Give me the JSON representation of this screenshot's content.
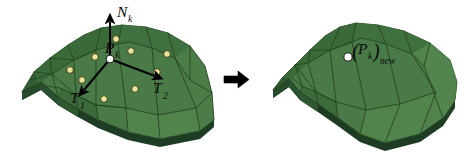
{
  "figure": {
    "background_color": "#ffffff",
    "width": 476,
    "height": 159
  },
  "colors": {
    "surface_light": "#5c8a55",
    "surface_mid": "#4a7a47",
    "surface_dark": "#3d6b3b",
    "surface_darker": "#2f5730",
    "surface_shadow": "#27492a",
    "side_face": "#2b5230",
    "side_face_dark": "#1e3c23",
    "mesh_line": "#24431f",
    "control_point_fill": "#e8e4a0",
    "control_point_stroke": "#3a3a12",
    "vertex_point_fill": "#ffffff",
    "vertex_point_stroke": "#1a1a1a",
    "arrow_black": "#000000",
    "label_text": "#0a0a0a"
  },
  "left_panel": {
    "name": "original-surface-patch",
    "labels": {
      "normal": {
        "base": "N",
        "subscript": "k"
      },
      "point": {
        "base": "P",
        "subscript": "k"
      },
      "tangent1": {
        "base": "T",
        "subscript": "1"
      },
      "tangent2": {
        "base": "T",
        "subscript": "2"
      }
    },
    "vectors": [
      {
        "name": "normal-vector",
        "label": "N_k"
      },
      {
        "name": "tangent-vector-1",
        "label": "T_1"
      },
      {
        "name": "tangent-vector-2",
        "label": "T_2"
      }
    ],
    "control_point_count": 9
  },
  "transform_arrow": {
    "name": "transform-arrow",
    "direction": "right",
    "glyph": "→"
  },
  "right_panel": {
    "name": "updated-surface-patch",
    "labels": {
      "point_new": {
        "open_paren": "(",
        "base": "P",
        "subscript": "k",
        "close_paren": ")",
        "suffix": "new"
      }
    }
  }
}
